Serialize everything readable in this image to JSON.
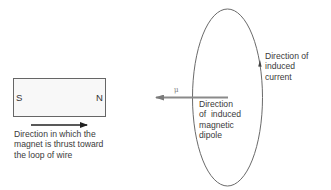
{
  "figure": {
    "magnet": {
      "south_label": "S",
      "north_label": "N"
    },
    "labels": {
      "thrust_direction": "Direction in which the\nmagnet is thrust toward\nthe loop of wire",
      "induced_current": "Direction of\ninduced\ncurrent",
      "induced_dipole": "Direction\nof  induced\nmagnetic\ndipole",
      "dipole_symbol": "μ"
    },
    "colors": {
      "line": "#555555",
      "dipole_arrow": "#8a8a8a",
      "magnet_fill": "#f7f7f7"
    }
  }
}
